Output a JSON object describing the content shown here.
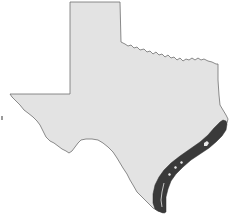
{
  "map": {
    "region": "Texas",
    "highlighted_region": "Gulf Coast",
    "colors": {
      "state_fill": "#e3e3e3",
      "state_outline": "#6e6e6e",
      "highlight_fill": "#3a3a3a",
      "background": "#ffffff"
    }
  }
}
